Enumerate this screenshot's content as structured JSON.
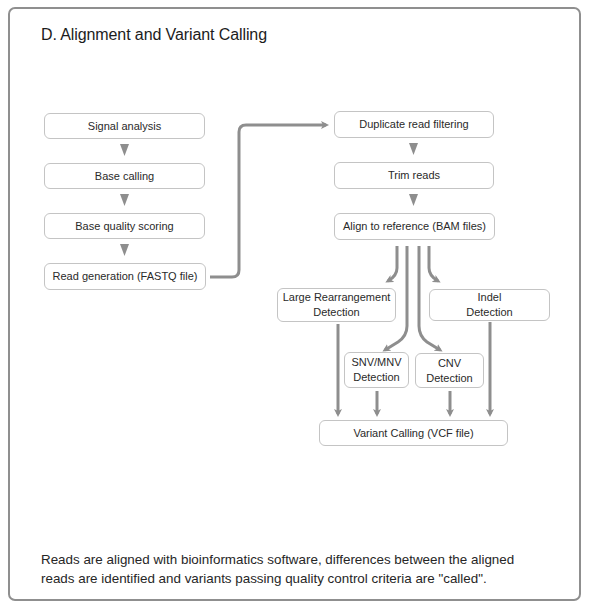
{
  "figure": {
    "title": "D. Alignment and Variant Calling",
    "caption_line1": "Reads are aligned with bioinformatics software, differences between the aligned",
    "caption_line2": "reads are identified and variants passing quality control criteria are \"called\".",
    "connector_color": "#8e8e8e",
    "box_border_color": "#c4c4c4"
  },
  "left_column": [
    {
      "label": "Signal analysis"
    },
    {
      "label": "Base calling"
    },
    {
      "label": "Base quality scoring"
    },
    {
      "label": "Read generation (FASTQ file)"
    }
  ],
  "right_column": [
    {
      "label": "Duplicate read filtering"
    },
    {
      "label": "Trim reads"
    },
    {
      "label": "Align to reference (BAM files)"
    }
  ],
  "detection": {
    "large_rearrangement": "Large Rearrangement\nDetection",
    "indel": "Indel\nDetection",
    "snv_mnv": "SNV/MNV\nDetection",
    "cnv": "CNV\nDetection"
  },
  "output": {
    "variant_calling": "Variant Calling (VCF file)"
  }
}
